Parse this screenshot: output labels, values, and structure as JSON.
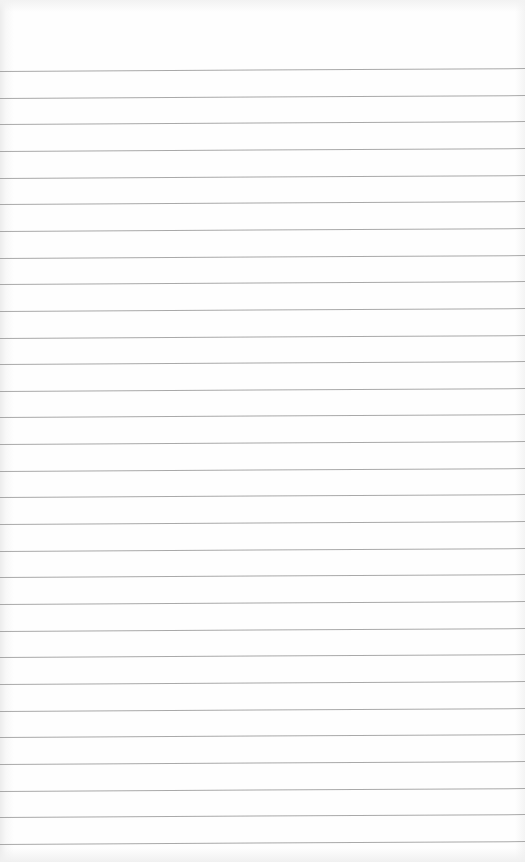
{
  "page": {
    "type": "lined-paper",
    "content": "",
    "line_color": "#9a9a9a",
    "background_color": "#fdfdfd",
    "line_count": 30,
    "first_line_y": 71,
    "line_spacing": 26.65
  }
}
